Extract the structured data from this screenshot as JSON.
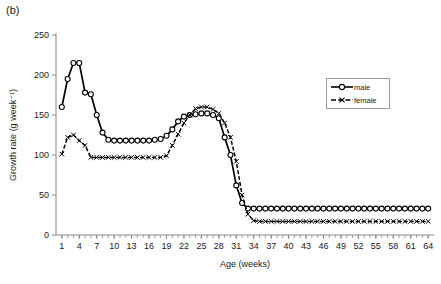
{
  "panel": {
    "label": "(b)"
  },
  "legend": {
    "position": "inside-right",
    "entries": [
      {
        "label": "male",
        "marker": "open-circle",
        "line": "solid"
      },
      {
        "label": "female",
        "marker": "cross-x",
        "line": "dashed"
      }
    ]
  },
  "chart_data": {
    "type": "line",
    "title": "",
    "subtitle": "",
    "xlabel": "Age (weeks)",
    "ylabel": "Growth rate (g week⁻¹)",
    "xlim": [
      0,
      65
    ],
    "ylim": [
      0,
      250
    ],
    "yticks": [
      0,
      50,
      100,
      150,
      200,
      250
    ],
    "xticks": [
      1,
      4,
      7,
      10,
      13,
      16,
      19,
      22,
      25,
      28,
      31,
      34,
      37,
      40,
      43,
      46,
      49,
      52,
      55,
      58,
      61,
      64
    ],
    "xtick_labels": [
      "1",
      "4",
      "7",
      "10",
      "13",
      "16",
      "19",
      "22",
      "25",
      "28",
      "31",
      "34",
      "37",
      "40",
      "43",
      "46",
      "49",
      "52",
      "55",
      "58",
      "61",
      "64"
    ],
    "ytick_labels": [
      "0",
      "50",
      "100",
      "150",
      "200",
      "250"
    ],
    "grid": false,
    "legend_position": "inside-right",
    "x": [
      1,
      2,
      3,
      4,
      5,
      6,
      7,
      8,
      9,
      10,
      11,
      12,
      13,
      14,
      15,
      16,
      17,
      18,
      19,
      20,
      21,
      22,
      23,
      24,
      25,
      26,
      27,
      28,
      29,
      30,
      31,
      32,
      33,
      34,
      35,
      36,
      37,
      38,
      39,
      40,
      41,
      42,
      43,
      44,
      45,
      46,
      47,
      48,
      49,
      50,
      51,
      52,
      53,
      54,
      55,
      56,
      57,
      58,
      59,
      60,
      61,
      62,
      63,
      64
    ],
    "series": [
      {
        "name": "male",
        "marker": "open-circle",
        "line": "solid",
        "color": "#000000",
        "values": [
          160,
          195,
          215,
          215,
          178,
          176,
          150,
          128,
          119,
          118,
          118,
          118,
          118,
          118,
          118,
          118,
          119,
          120,
          124,
          132,
          142,
          148,
          150,
          151,
          152,
          152,
          150,
          146,
          122,
          100,
          62,
          40,
          33,
          33,
          33,
          33,
          33,
          33,
          33,
          33,
          33,
          33,
          33,
          33,
          33,
          33,
          33,
          33,
          33,
          33,
          33,
          33,
          33,
          33,
          33,
          33,
          33,
          33,
          33,
          33,
          33,
          33,
          33,
          33
        ]
      },
      {
        "name": "female",
        "marker": "cross-x",
        "line": "dashed",
        "color": "#000000",
        "values": [
          101,
          122,
          125,
          118,
          112,
          97,
          97,
          97,
          97,
          97,
          97,
          97,
          97,
          97,
          97,
          97,
          97,
          97,
          99,
          112,
          126,
          140,
          150,
          158,
          160,
          160,
          157,
          152,
          140,
          122,
          92,
          50,
          26,
          18,
          17,
          17,
          17,
          17,
          17,
          17,
          17,
          17,
          17,
          17,
          17,
          17,
          17,
          17,
          17,
          17,
          17,
          17,
          17,
          17,
          17,
          17,
          17,
          17,
          17,
          17,
          17,
          17,
          17,
          17
        ]
      }
    ]
  }
}
